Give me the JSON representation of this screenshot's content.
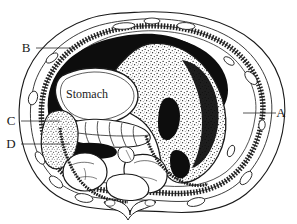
{
  "figure": {
    "background_color": "#ffffff",
    "ink_color": "#1a1a1a"
  },
  "labels": [
    {
      "id": "A",
      "text": "A",
      "x": 281,
      "y": 117,
      "leader_from_x": 276,
      "leader_from_y": 113,
      "leader_to_x": 243,
      "leader_to_y": 113,
      "target": "liver-right-lobe-edge"
    },
    {
      "id": "B",
      "text": "B",
      "x": 24,
      "y": 52,
      "leader_from_x": 36,
      "leader_from_y": 48,
      "leader_to_x": 74,
      "leader_to_y": 48,
      "target": "abdominal-wall-upper-left"
    },
    {
      "id": "C",
      "text": "C",
      "x": 9,
      "y": 125,
      "leader_from_x": 21,
      "leader_from_y": 121,
      "leader_to_x": 60,
      "leader_to_y": 121,
      "target": "spleen-region"
    },
    {
      "id": "D",
      "text": "D",
      "x": 9,
      "y": 148,
      "leader_from_x": 21,
      "leader_from_y": 144,
      "leader_to_x": 70,
      "leader_to_y": 144,
      "target": "splenic-vessel-region"
    }
  ],
  "organ_labels": [
    {
      "name": "stomach",
      "text": "Stomach",
      "x": 66,
      "y": 94
    }
  ],
  "structures": [
    {
      "name": "body-wall-outline",
      "kind": "outline"
    },
    {
      "name": "peritoneal-cavity-outline",
      "kind": "outline"
    },
    {
      "name": "abdominal-musculature-band",
      "kind": "hatched-band"
    },
    {
      "name": "liver-right-lobe",
      "kind": "stippled-organ"
    },
    {
      "name": "stomach-lumen",
      "kind": "dark-lumen"
    },
    {
      "name": "stomach-wall",
      "kind": "outline"
    },
    {
      "name": "pancreas",
      "kind": "lobulated-organ"
    },
    {
      "name": "spleen",
      "kind": "stippled-organ"
    },
    {
      "name": "splenic-vein",
      "kind": "dark-lumen"
    },
    {
      "name": "left-kidney",
      "kind": "outline-organ"
    },
    {
      "name": "right-kidney",
      "kind": "outline-organ"
    },
    {
      "name": "vertebral-body",
      "kind": "outline-organ"
    },
    {
      "name": "vertebral-arch",
      "kind": "outline-organ"
    },
    {
      "name": "aorta",
      "kind": "small-vessel"
    },
    {
      "name": "back-muscles",
      "kind": "small-muscle"
    }
  ]
}
